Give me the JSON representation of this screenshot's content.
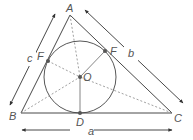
{
  "diagram": {
    "colors": {
      "line": "#333333",
      "dashed": "#888888",
      "point": "#555555",
      "label": "#555555",
      "background": "#ffffff"
    },
    "vertices": {
      "A": {
        "label": "A",
        "x": 70,
        "y": 15
      },
      "B": {
        "label": "B",
        "x": 21,
        "y": 113
      },
      "C": {
        "label": "C",
        "x": 172,
        "y": 113
      }
    },
    "incircle": {
      "center": {
        "label": "O",
        "x": 80,
        "y": 77
      },
      "radius": 36
    },
    "tangent_points": [
      {
        "label": "F",
        "side": "AB",
        "x": 48,
        "y": 61
      },
      {
        "label": "F",
        "side": "AC",
        "x": 105,
        "y": 51
      },
      {
        "label": "D",
        "side": "BC",
        "x": 80,
        "y": 113
      }
    ],
    "side_labels": {
      "a": "a",
      "b": "b",
      "c": "c"
    }
  }
}
